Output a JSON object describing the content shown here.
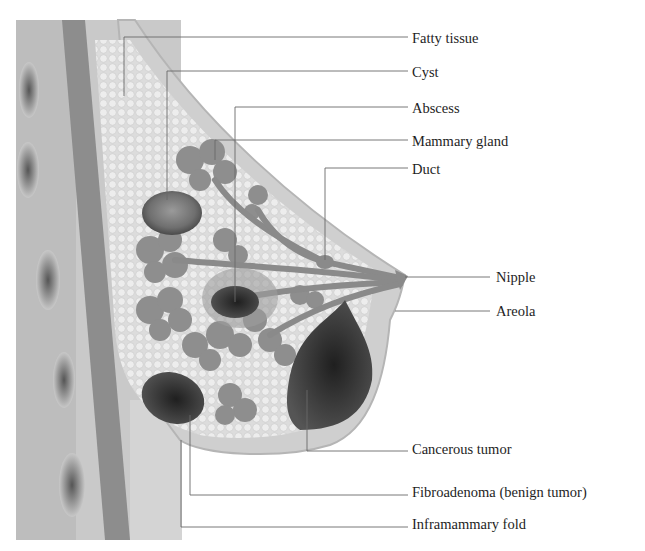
{
  "diagram": {
    "labels": [
      {
        "id": "fatty-tissue",
        "text": "Fatty tissue",
        "y": 40
      },
      {
        "id": "cyst",
        "text": "Cyst",
        "y": 74
      },
      {
        "id": "abscess",
        "text": "Abscess",
        "y": 111
      },
      {
        "id": "mammary-gland",
        "text": "Mammary gland",
        "y": 143
      },
      {
        "id": "duct",
        "text": "Duct",
        "y": 171
      },
      {
        "id": "nipple",
        "text": "Nipple",
        "y": 279
      },
      {
        "id": "areola",
        "text": "Areola",
        "y": 312
      },
      {
        "id": "cancerous-tumor",
        "text": "Cancerous tumor",
        "y": 450
      },
      {
        "id": "fibroadenoma",
        "text": "Fibroadenoma (benign tumor)",
        "y": 493
      },
      {
        "id": "inframammary-fold",
        "text": "Inframammary fold",
        "y": 526
      }
    ]
  }
}
